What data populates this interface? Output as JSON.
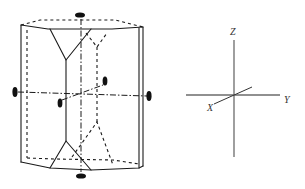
{
  "figure": {
    "crystal": {
      "shape": "hexagonal-prism",
      "symmetry_markers": [
        {
          "name": "top-2fold-marker",
          "orientation": "horizontal",
          "cx": 80,
          "cy": 15
        },
        {
          "name": "bottom-2fold-marker",
          "orientation": "horizontal",
          "cx": 81,
          "cy": 176
        },
        {
          "name": "left-2fold-marker",
          "orientation": "vertical",
          "cx": 15,
          "cy": 92
        },
        {
          "name": "right-2fold-marker",
          "orientation": "vertical",
          "cx": 149,
          "cy": 96
        },
        {
          "name": "inner-2fold-marker-upper",
          "orientation": "vertical",
          "cx": 105,
          "cy": 81
        },
        {
          "name": "inner-2fold-marker-front",
          "orientation": "vertical",
          "cx": 60,
          "cy": 103
        }
      ]
    },
    "axes_key": {
      "labels": {
        "z": "Z",
        "x": "X",
        "y": "Y"
      },
      "colors": {
        "axis_line": "#6b6b6b",
        "label": "#333333"
      }
    }
  }
}
